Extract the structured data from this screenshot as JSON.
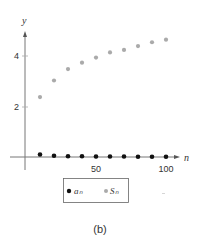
{
  "chart_data": {
    "type": "scatter",
    "title": "",
    "caption": "(b)",
    "xlabel": "n",
    "ylabel": "y",
    "xlim": [
      0,
      105
    ],
    "ylim": [
      0,
      5
    ],
    "x_ticks": [
      50,
      100
    ],
    "x_tick_labels": [
      "50",
      "100"
    ],
    "y_ticks": [
      2,
      4
    ],
    "y_tick_labels": [
      "2",
      "4"
    ],
    "grid": false,
    "legend_position": "bottom",
    "x": [
      10,
      20,
      30,
      40,
      50,
      60,
      70,
      80,
      90,
      100
    ],
    "series": [
      {
        "name": "a_n",
        "label": "aₙ",
        "color": "#111111",
        "values": [
          0.1,
          0.05,
          0.03,
          0.03,
          0.02,
          0.02,
          0.02,
          0.01,
          0.01,
          0.01
        ]
      },
      {
        "name": "S_n",
        "label": "Sₙ",
        "color": "#aaaaaa",
        "values": [
          2.35,
          3.0,
          3.45,
          3.7,
          3.9,
          4.1,
          4.2,
          4.35,
          4.5,
          4.6
        ]
      }
    ]
  },
  "labels": {
    "x_axis": "n",
    "y_axis": "y",
    "legend_a": "aₙ",
    "legend_s": "Sₙ",
    "caption": "(b)",
    "tick_50": "50",
    "tick_100": "100",
    "tick_2": "2",
    "tick_4": "4"
  }
}
